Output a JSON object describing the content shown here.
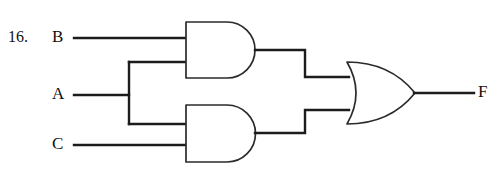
{
  "diagram": {
    "kind": "logic-circuit",
    "problem_number": "16.",
    "inputs": [
      {
        "id": "B",
        "label": "B",
        "label_x": 58,
        "label_y": 38
      },
      {
        "id": "A",
        "label": "A",
        "label_x": 58,
        "label_y": 95
      },
      {
        "id": "C",
        "label": "C",
        "label_x": 58,
        "label_y": 145
      }
    ],
    "output": {
      "id": "F",
      "label": "F",
      "label_x": 482,
      "label_y": 93
    },
    "gates": [
      {
        "id": "and-top",
        "type": "AND",
        "inputs": [
          "B",
          "A"
        ],
        "x": 186,
        "y": 22,
        "w": 82,
        "h": 56
      },
      {
        "id": "and-bottom",
        "type": "AND",
        "inputs": [
          "A",
          "C"
        ],
        "x": 186,
        "y": 105,
        "w": 82,
        "h": 57
      },
      {
        "id": "or-out",
        "type": "OR",
        "inputs": [
          "and-top",
          "and-bottom"
        ],
        "x": 347,
        "y": 62,
        "w": 68,
        "h": 62
      }
    ],
    "expression": "F = (B AND A) OR (A AND C)",
    "colors": {
      "background": "#ffffff",
      "wire": "#1c1c1c",
      "gate_outline": "#2b2b2b",
      "text": "#111111"
    }
  }
}
